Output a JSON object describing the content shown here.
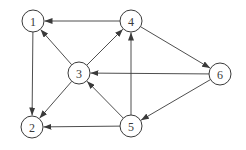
{
  "diagram": {
    "type": "directed-graph",
    "node_radius": 11,
    "colors": {
      "stroke": "#3a3a3a",
      "fill": "#ffffff",
      "background": "#ffffff"
    },
    "nodes": [
      {
        "id": "1",
        "label": "1",
        "x": 33,
        "y": 21
      },
      {
        "id": "2",
        "label": "2",
        "x": 32,
        "y": 127
      },
      {
        "id": "3",
        "label": "3",
        "x": 79,
        "y": 73
      },
      {
        "id": "4",
        "label": "4",
        "x": 131,
        "y": 21
      },
      {
        "id": "5",
        "label": "5",
        "x": 131,
        "y": 126
      },
      {
        "id": "6",
        "label": "6",
        "x": 220,
        "y": 74
      }
    ],
    "edges": [
      {
        "from": "4",
        "to": "1"
      },
      {
        "from": "1",
        "to": "2"
      },
      {
        "from": "3",
        "to": "1"
      },
      {
        "from": "3",
        "to": "4"
      },
      {
        "from": "3",
        "to": "2"
      },
      {
        "from": "6",
        "to": "3"
      },
      {
        "from": "5",
        "to": "3"
      },
      {
        "from": "5",
        "to": "4"
      },
      {
        "from": "5",
        "to": "2"
      },
      {
        "from": "4",
        "to": "6"
      },
      {
        "from": "6",
        "to": "5"
      }
    ]
  }
}
